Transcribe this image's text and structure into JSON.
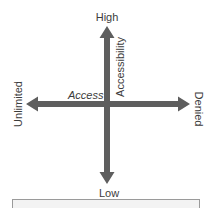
{
  "diagram": {
    "type": "quadrant-axes",
    "arrow_color": "#5e5e5e",
    "vertical_axis": {
      "name": "Accessibility",
      "top_label": "High",
      "bottom_label": "Low"
    },
    "horizontal_axis": {
      "name": "Access",
      "left_label": "Unlimited",
      "right_label": "Denied"
    },
    "caption_box": {
      "text": "",
      "background": "#f3f3f3",
      "border": "#9a9a9a"
    }
  }
}
